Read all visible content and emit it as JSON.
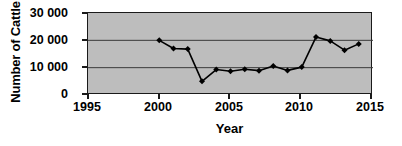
{
  "chart_data": {
    "type": "line",
    "title": "",
    "xlabel": "Year",
    "ylabel": "Number of Cattle",
    "xlim": [
      1995,
      2015
    ],
    "ylim": [
      0,
      30000
    ],
    "grid": true,
    "legend": "none",
    "plot_background": "#bdbdbd",
    "series_color": "#000000",
    "marker": "diamond",
    "x": [
      2000,
      2001,
      2002,
      2003,
      2004,
      2005,
      2006,
      2007,
      2008,
      2009,
      2010,
      2011,
      2012,
      2013,
      2014
    ],
    "values": [
      20000,
      17000,
      16800,
      5000,
      9300,
      8700,
      9400,
      8900,
      10600,
      9000,
      10200,
      21200,
      19800,
      16400,
      18700
    ],
    "series": [
      {
        "name": "Number of Cattle",
        "values": [
          20000,
          17000,
          16800,
          5000,
          9300,
          8700,
          9400,
          8900,
          10600,
          9000,
          10200,
          21200,
          19800,
          16400,
          18700
        ]
      }
    ],
    "x_ticks": [
      {
        "value": 1995,
        "label": "1995"
      },
      {
        "value": 2000,
        "label": "2000"
      },
      {
        "value": 2005,
        "label": "2005"
      },
      {
        "value": 2010,
        "label": "2010"
      },
      {
        "value": 2015,
        "label": "2015"
      }
    ],
    "y_ticks": [
      {
        "value": 30000,
        "label": "30 000"
      },
      {
        "value": 20000,
        "label": "20 000"
      },
      {
        "value": 10000,
        "label": "10 000"
      },
      {
        "value": 0,
        "label": "0"
      }
    ],
    "gridlines_y": [
      10000,
      20000
    ]
  }
}
